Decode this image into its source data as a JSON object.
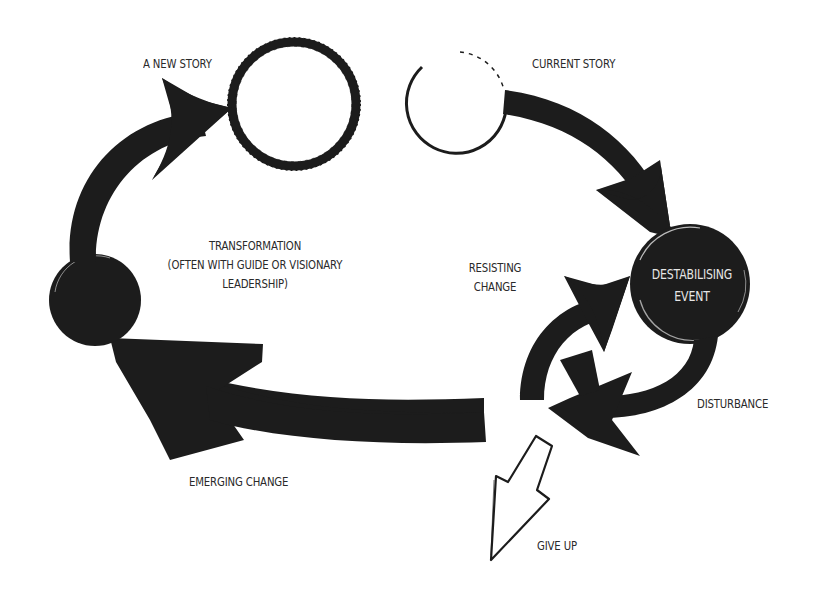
{
  "diagram": {
    "type": "cycle",
    "colors": {
      "background": "#ffffff",
      "ink": "#1c1c1c",
      "text": "#2a2a2a",
      "text_on_dark": "#e6e6e6"
    },
    "nodes": {
      "new_story": {
        "label": "A NEW STORY",
        "style": "hollow-rough-circle"
      },
      "current_story": {
        "label": "CURRENT STORY",
        "style": "hollow-thin-circle"
      },
      "destabilising_event": {
        "label_line1": "DESTABILISING",
        "label_line2": "EVENT",
        "style": "filled-circle"
      },
      "transformation": {
        "style": "filled-circle"
      }
    },
    "labels": {
      "new_story": "A NEW STORY",
      "current_story": "CURRENT STORY",
      "transformation_line1": "TRANSFORMATION",
      "transformation_line2": "(OFTEN WITH GUIDE OR VISIONARY",
      "transformation_line3": "LEADERSHIP)",
      "resisting_line1": "RESISTING",
      "resisting_line2": "CHANGE",
      "destabilising_line1": "DESTABILISING",
      "destabilising_line2": "EVENT",
      "disturbance": "DISTURBANCE",
      "emerging_change": "EMERGING CHANGE",
      "give_up": "GIVE UP"
    },
    "edges": [
      {
        "from": "current_story",
        "to": "destabilising_event",
        "style": "thick-arrow"
      },
      {
        "from": "destabilising_event",
        "to": "resisting_change_loop",
        "label": "DISTURBANCE",
        "style": "thick-arrow"
      },
      {
        "from": "resisting_change_loop",
        "to": "resisting_change_loop",
        "label": "RESISTING CHANGE",
        "style": "circular-arrows"
      },
      {
        "from": "resisting_change_loop",
        "to": "give_up",
        "label": "GIVE UP",
        "style": "outline-arrow"
      },
      {
        "from": "resisting_change_loop",
        "to": "transformation",
        "label": "EMERGING CHANGE",
        "style": "thick-arrow"
      },
      {
        "from": "transformation",
        "to": "new_story",
        "style": "thick-arrow"
      }
    ]
  }
}
